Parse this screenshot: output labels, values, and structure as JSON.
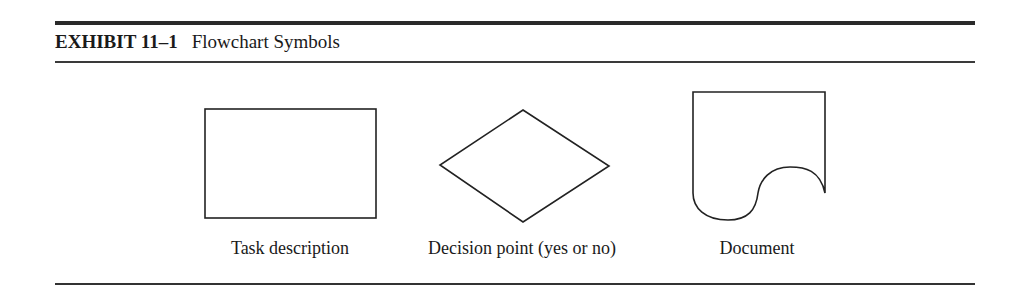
{
  "exhibit": {
    "label": "EXHIBIT 11–1",
    "title": "Flowchart Symbols"
  },
  "symbols": [
    {
      "shape": "rectangle",
      "caption": "Task description"
    },
    {
      "shape": "diamond",
      "caption": "Decision point (yes or no)"
    },
    {
      "shape": "document",
      "caption": "Document"
    }
  ],
  "colors": {
    "stroke": "#222222",
    "background": "#ffffff"
  }
}
